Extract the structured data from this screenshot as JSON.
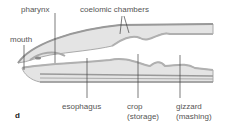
{
  "diagram": {
    "panel_label": "d",
    "labels": {
      "pharynx": "pharynx",
      "coelomic_chambers": "coelomic chambers",
      "mouth": "mouth",
      "esophagus": "esophagus",
      "crop": "crop",
      "crop_note": "(storage)",
      "gizzard": "gizzard",
      "gizzard_note": "(mashing)"
    },
    "colors": {
      "body_wall": "#b8b8b8",
      "body_fill": "#e2e2e2",
      "gut": "#c8c8c8",
      "leader": "#444444",
      "text": "#555555"
    }
  }
}
